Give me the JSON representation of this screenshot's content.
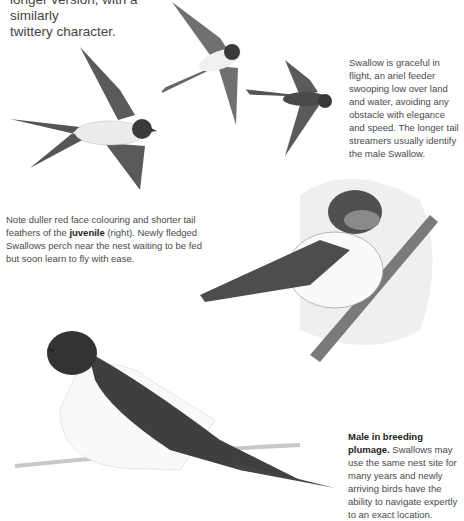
{
  "intro": {
    "line1": "longer version, with a similarly",
    "line2": "twittery character."
  },
  "captions": {
    "flight": "Swallow is graceful in flight, an ariel feeder swooping low over land and water, avoiding any obstacle with elegance and speed. The longer tail streamers usually identify the male Swallow.",
    "juvenile_pre": "Note duller red face colouring and shorter tail feathers of the ",
    "juvenile_bold": "juvenile",
    "juvenile_post": " (right). Newly fledged Swallows perch near the nest waiting to be fed but soon learn to fly with ease.",
    "male_bold": "Male in breeding plumage.",
    "male_text": " Swallows may use the same nest site for many years and newly arriving birds have the ability to navigate expertly to an exact location."
  },
  "illustrations": [
    {
      "name": "swallow-flying-left",
      "label": "Swallow in flight, underside view"
    },
    {
      "name": "swallow-flying-top",
      "label": "Swallow in flight, banking"
    },
    {
      "name": "swallow-flying-right",
      "label": "Swallow in flight, upper view"
    },
    {
      "name": "juvenile-swallow-perched",
      "label": "Juvenile swallow perched on branch"
    },
    {
      "name": "male-swallow-on-wire",
      "label": "Male swallow perched on wire"
    }
  ],
  "colors": {
    "text": "#444444",
    "bird_dark": "#3a3a3a",
    "bird_mid": "#6b6b6b",
    "bird_light": "#e8e8e8"
  }
}
